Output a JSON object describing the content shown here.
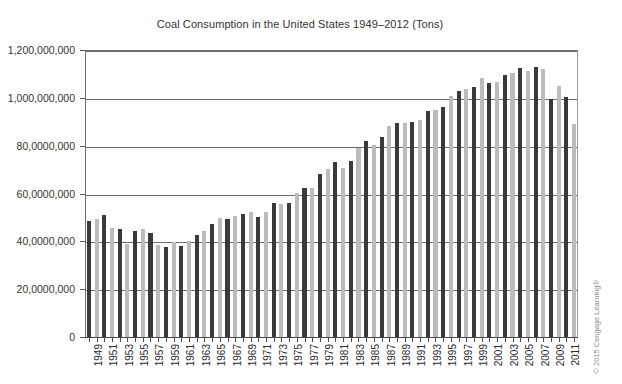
{
  "chart_data": {
    "type": "bar",
    "title": "Coal Consumption in the United States 1949–2012 (Tons)",
    "xlabel": "",
    "ylabel": "",
    "ylim": [
      0,
      1200000000
    ],
    "grid": true,
    "legend": null,
    "ytick_labels": [
      "0",
      "20,0000,000",
      "40,0000,000",
      "60,0000,000",
      "80,0000,000",
      "1,000,000,000",
      "1,200,000,000"
    ],
    "ytick_values": [
      0,
      200000000,
      400000000,
      600000000,
      800000000,
      1000000000,
      1200000000
    ],
    "categories": [
      "1949",
      "1950",
      "1951",
      "1952",
      "1953",
      "1954",
      "1955",
      "1956",
      "1957",
      "1958",
      "1959",
      "1960",
      "1961",
      "1962",
      "1963",
      "1964",
      "1965",
      "1966",
      "1967",
      "1968",
      "1969",
      "1970",
      "1971",
      "1972",
      "1973",
      "1974",
      "1975",
      "1976",
      "1977",
      "1978",
      "1979",
      "1980",
      "1981",
      "1982",
      "1983",
      "1984",
      "1985",
      "1986",
      "1987",
      "1988",
      "1989",
      "1990",
      "1991",
      "1992",
      "1993",
      "1994",
      "1995",
      "1996",
      "1997",
      "1998",
      "1999",
      "2000",
      "2001",
      "2002",
      "2003",
      "2004",
      "2005",
      "2006",
      "2007",
      "2008",
      "2009",
      "2010",
      "2011",
      "2012"
    ],
    "xtick_labels_shown": [
      "1949",
      "1951",
      "1953",
      "1955",
      "1957",
      "1959",
      "1961",
      "1963",
      "1965",
      "1967",
      "1969",
      "1971",
      "1973",
      "1975",
      "1977",
      "1979",
      "1981",
      "1983",
      "1985",
      "1987",
      "1989",
      "1991",
      "1993",
      "1995",
      "1997",
      "1999",
      "2001",
      "2003",
      "2005",
      "2007",
      "2009",
      "2011"
    ],
    "values": [
      483000000,
      495000000,
      510000000,
      455000000,
      450000000,
      390000000,
      443000000,
      450000000,
      435000000,
      385000000,
      378000000,
      398000000,
      382000000,
      402000000,
      425000000,
      445000000,
      472000000,
      497000000,
      492000000,
      508000000,
      516000000,
      523000000,
      501000000,
      524000000,
      562000000,
      558000000,
      562000000,
      603000000,
      625000000,
      625000000,
      680000000,
      702000000,
      732000000,
      707000000,
      736000000,
      791000000,
      818000000,
      804000000,
      836000000,
      884000000,
      895000000,
      895000000,
      900000000,
      907000000,
      944000000,
      951000000,
      962000000,
      1006000000,
      1030000000,
      1037000000,
      1045000000,
      1084000000,
      1060000000,
      1066000000,
      1095000000,
      1104000000,
      1126000000,
      1112000000,
      1128000000,
      1121000000,
      997000000,
      1048000000,
      1003000000,
      889000000
    ],
    "bar_colors": {
      "dark": "#3a3a3a",
      "light": "#bcbcbc",
      "pattern": "alternating"
    }
  },
  "credit": {
    "text": "© 2015 Cengage Learning®"
  }
}
